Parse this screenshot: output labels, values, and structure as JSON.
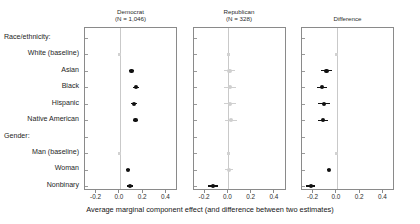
{
  "figure": {
    "x_axis_caption": "Average marginal component effect (and difference between two estimates)"
  },
  "panels": [
    {
      "key": "democrat",
      "title": "Democrat",
      "subtitle": "(N = 1,046)"
    },
    {
      "key": "republican",
      "title": "Republican",
      "subtitle": "(N = 328)"
    },
    {
      "key": "difference",
      "title": "Difference",
      "subtitle": ""
    }
  ],
  "axis": {
    "ticks": [
      "-0.2",
      "0.0",
      "0.2",
      "0.4"
    ],
    "tick_values": [
      -0.2,
      0.0,
      0.2,
      0.4
    ],
    "xlim": [
      -0.3,
      0.5
    ]
  },
  "rows": [
    {
      "label": "Race/ethnicity:",
      "type": "group"
    },
    {
      "label": "White (baseline)",
      "type": "baseline"
    },
    {
      "label": "Asian",
      "type": "estimate"
    },
    {
      "label": "Black",
      "type": "estimate"
    },
    {
      "label": "Hispanic",
      "type": "estimate"
    },
    {
      "label": "Native American",
      "type": "estimate"
    },
    {
      "label": "Gender:",
      "type": "group"
    },
    {
      "label": "Man (baseline)",
      "type": "baseline"
    },
    {
      "label": "Woman",
      "type": "estimate"
    },
    {
      "label": "Nonbinary",
      "type": "estimate"
    }
  ],
  "chart_data": {
    "type": "scatter",
    "title": "",
    "subtitle": "",
    "xlabel": "Average marginal component effect (and difference between two estimates)",
    "ylabel": "",
    "xlim": [
      -0.3,
      0.5
    ],
    "grid": false,
    "legend": "none",
    "reference_line": 0.0,
    "categories": [
      "Race/ethnicity:",
      "White (baseline)",
      "Asian",
      "Black",
      "Hispanic",
      "Native American",
      "Gender:",
      "Man (baseline)",
      "Woman",
      "Nonbinary"
    ],
    "panel_labels": [
      "Democrat (N = 1,046)",
      "Republican (N = 328)",
      "Difference"
    ],
    "series": [
      {
        "name": "Democrat",
        "n": 1046,
        "points": [
          {
            "row": "Race/ethnicity:",
            "estimate": null,
            "ci_low": null,
            "ci_high": null,
            "style": "none"
          },
          {
            "row": "White (baseline)",
            "estimate": 0.0,
            "ci_low": 0.0,
            "ci_high": 0.0,
            "style": "baseline"
          },
          {
            "row": "Asian",
            "estimate": 0.1,
            "ci_low": 0.075,
            "ci_high": 0.125,
            "style": "significant"
          },
          {
            "row": "Black",
            "estimate": 0.14,
            "ci_low": 0.115,
            "ci_high": 0.165,
            "style": "significant"
          },
          {
            "row": "Hispanic",
            "estimate": 0.12,
            "ci_low": 0.095,
            "ci_high": 0.145,
            "style": "significant"
          },
          {
            "row": "Native American",
            "estimate": 0.135,
            "ci_low": 0.11,
            "ci_high": 0.16,
            "style": "significant"
          },
          {
            "row": "Gender:",
            "estimate": null,
            "ci_low": null,
            "ci_high": null,
            "style": "none"
          },
          {
            "row": "Man (baseline)",
            "estimate": 0.0,
            "ci_low": 0.0,
            "ci_high": 0.0,
            "style": "baseline"
          },
          {
            "row": "Woman",
            "estimate": 0.07,
            "ci_low": 0.05,
            "ci_high": 0.09,
            "style": "significant"
          },
          {
            "row": "Nonbinary",
            "estimate": 0.09,
            "ci_low": 0.065,
            "ci_high": 0.115,
            "style": "significant"
          }
        ]
      },
      {
        "name": "Republican",
        "n": 328,
        "points": [
          {
            "row": "Race/ethnicity:",
            "estimate": null,
            "ci_low": null,
            "ci_high": null,
            "style": "none"
          },
          {
            "row": "White (baseline)",
            "estimate": 0.0,
            "ci_low": 0.0,
            "ci_high": 0.0,
            "style": "baseline"
          },
          {
            "row": "Asian",
            "estimate": 0.01,
            "ci_low": -0.04,
            "ci_high": 0.06,
            "style": "nonsignificant"
          },
          {
            "row": "Black",
            "estimate": 0.015,
            "ci_low": -0.035,
            "ci_high": 0.065,
            "style": "nonsignificant"
          },
          {
            "row": "Hispanic",
            "estimate": 0.015,
            "ci_low": -0.035,
            "ci_high": 0.065,
            "style": "nonsignificant"
          },
          {
            "row": "Native American",
            "estimate": 0.02,
            "ci_low": -0.03,
            "ci_high": 0.07,
            "style": "nonsignificant"
          },
          {
            "row": "Gender:",
            "estimate": null,
            "ci_low": null,
            "ci_high": null,
            "style": "none"
          },
          {
            "row": "Man (baseline)",
            "estimate": 0.0,
            "ci_low": 0.0,
            "ci_high": 0.0,
            "style": "baseline"
          },
          {
            "row": "Woman",
            "estimate": 0.005,
            "ci_low": -0.03,
            "ci_high": 0.04,
            "style": "nonsignificant"
          },
          {
            "row": "Nonbinary",
            "estimate": -0.13,
            "ci_low": -0.175,
            "ci_high": -0.085,
            "style": "significant"
          }
        ]
      },
      {
        "name": "Difference",
        "n": null,
        "points": [
          {
            "row": "Race/ethnicity:",
            "estimate": null,
            "ci_low": null,
            "ci_high": null,
            "style": "none"
          },
          {
            "row": "White (baseline)",
            "estimate": 0.0,
            "ci_low": 0.0,
            "ci_high": 0.0,
            "style": "baseline"
          },
          {
            "row": "Asian",
            "estimate": -0.09,
            "ci_low": -0.135,
            "ci_high": -0.045,
            "style": "significant"
          },
          {
            "row": "Black",
            "estimate": -0.13,
            "ci_low": -0.175,
            "ci_high": -0.085,
            "style": "significant"
          },
          {
            "row": "Hispanic",
            "estimate": -0.11,
            "ci_low": -0.16,
            "ci_high": -0.06,
            "style": "significant"
          },
          {
            "row": "Native American",
            "estimate": -0.12,
            "ci_low": -0.165,
            "ci_high": -0.075,
            "style": "significant"
          },
          {
            "row": "Gender:",
            "estimate": null,
            "ci_low": null,
            "ci_high": null,
            "style": "none"
          },
          {
            "row": "Man (baseline)",
            "estimate": 0.0,
            "ci_low": 0.0,
            "ci_high": 0.0,
            "style": "baseline"
          },
          {
            "row": "Woman",
            "estimate": -0.07,
            "ci_low": -0.085,
            "ci_high": -0.055,
            "style": "significant"
          },
          {
            "row": "Nonbinary",
            "estimate": -0.225,
            "ci_low": -0.265,
            "ci_high": -0.185,
            "style": "significant"
          }
        ]
      }
    ]
  }
}
